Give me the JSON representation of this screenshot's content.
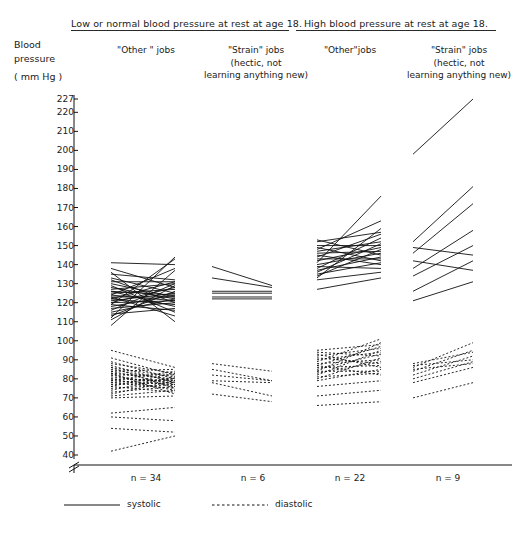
{
  "chart_data": {
    "type": "line",
    "title": "",
    "xlabel": "",
    "ylabel": "Blood pressure (mm Hg)",
    "ylim": [
      40,
      227
    ],
    "axis_break_below": 40,
    "grid": false,
    "legend_position": "bottom-left",
    "yticks": [
      227,
      220,
      210,
      200,
      190,
      180,
      170,
      160,
      150,
      140,
      130,
      120,
      110,
      100,
      90,
      80,
      70,
      60,
      50,
      40
    ],
    "x_categories": [
      "at age 18",
      "at follow-up"
    ],
    "groups": [
      {
        "panel": "Low or normal blood pressure at rest at age 18.",
        "job_type": "\"Other\" jobs",
        "n_label": "n = 34",
        "n": 34,
        "systolic": [
          [
            112,
            144
          ],
          [
            119,
            143
          ],
          [
            141,
            140
          ],
          [
            124,
            138
          ],
          [
            108,
            137
          ],
          [
            135,
            132
          ],
          [
            122,
            131
          ],
          [
            131,
            131
          ],
          [
            116,
            130
          ],
          [
            127,
            130
          ],
          [
            111,
            129
          ],
          [
            138,
            128
          ],
          [
            120,
            128
          ],
          [
            125,
            127
          ],
          [
            113,
            126
          ],
          [
            133,
            125
          ],
          [
            121,
            125
          ],
          [
            126,
            124
          ],
          [
            118,
            124
          ],
          [
            123,
            123
          ],
          [
            130,
            123
          ],
          [
            115,
            122
          ],
          [
            128,
            122
          ],
          [
            120,
            121
          ],
          [
            124,
            121
          ],
          [
            117,
            120
          ],
          [
            132,
            120
          ],
          [
            122,
            119
          ],
          [
            126,
            118
          ],
          [
            114,
            117
          ],
          [
            119,
            116
          ],
          [
            129,
            115
          ],
          [
            123,
            113
          ],
          [
            136,
            110
          ]
        ],
        "diastolic": [
          [
            95,
            86
          ],
          [
            84,
            85
          ],
          [
            79,
            84
          ],
          [
            88,
            83
          ],
          [
            76,
            83
          ],
          [
            82,
            82
          ],
          [
            91,
            82
          ],
          [
            74,
            81
          ],
          [
            86,
            81
          ],
          [
            78,
            80
          ],
          [
            83,
            80
          ],
          [
            89,
            80
          ],
          [
            72,
            79
          ],
          [
            80,
            79
          ],
          [
            85,
            79
          ],
          [
            77,
            78
          ],
          [
            81,
            78
          ],
          [
            87,
            78
          ],
          [
            75,
            77
          ],
          [
            79,
            77
          ],
          [
            84,
            77
          ],
          [
            73,
            76
          ],
          [
            82,
            76
          ],
          [
            78,
            75
          ],
          [
            86,
            75
          ],
          [
            71,
            74
          ],
          [
            80,
            74
          ],
          [
            76,
            73
          ],
          [
            83,
            72
          ],
          [
            70,
            71
          ],
          [
            62,
            65
          ],
          [
            60,
            58
          ],
          [
            54,
            52
          ],
          [
            42,
            50
          ]
        ]
      },
      {
        "panel": "Low or normal blood pressure at rest at age 18.",
        "job_type": "\"Strain\" jobs (hectic, not learning anything new)",
        "n_label": "n = 6",
        "n": 6,
        "systolic": [
          [
            139,
            129
          ],
          [
            133,
            128
          ],
          [
            126,
            126
          ],
          [
            125,
            125
          ],
          [
            123,
            123
          ],
          [
            122,
            122
          ]
        ],
        "diastolic": [
          [
            88,
            84
          ],
          [
            85,
            79
          ],
          [
            82,
            79
          ],
          [
            79,
            78
          ],
          [
            78,
            71
          ],
          [
            72,
            68
          ]
        ]
      },
      {
        "panel": "High blood pressure at rest at age 18.",
        "job_type": "\"Other\" jobs",
        "n_label": "n = 22",
        "n": 22,
        "systolic": [
          [
            141,
            176
          ],
          [
            148,
            163
          ],
          [
            133,
            159
          ],
          [
            152,
            157
          ],
          [
            144,
            156
          ],
          [
            138,
            154
          ],
          [
            147,
            152
          ],
          [
            136,
            151
          ],
          [
            150,
            150
          ],
          [
            142,
            149
          ],
          [
            134,
            148
          ],
          [
            146,
            147
          ],
          [
            140,
            146
          ],
          [
            153,
            145
          ],
          [
            137,
            144
          ],
          [
            143,
            143
          ],
          [
            149,
            142
          ],
          [
            135,
            141
          ],
          [
            145,
            140
          ],
          [
            139,
            138
          ],
          [
            132,
            136
          ],
          [
            127,
            133
          ]
        ],
        "diastolic": [
          [
            89,
            101
          ],
          [
            84,
            99
          ],
          [
            95,
            98
          ],
          [
            87,
            97
          ],
          [
            92,
            96
          ],
          [
            82,
            95
          ],
          [
            90,
            94
          ],
          [
            85,
            93
          ],
          [
            94,
            92
          ],
          [
            80,
            91
          ],
          [
            88,
            90
          ],
          [
            83,
            89
          ],
          [
            91,
            88
          ],
          [
            86,
            87
          ],
          [
            93,
            86
          ],
          [
            79,
            85
          ],
          [
            84,
            84
          ],
          [
            81,
            83
          ],
          [
            87,
            82
          ],
          [
            76,
            79
          ],
          [
            71,
            74
          ],
          [
            66,
            68
          ]
        ]
      },
      {
        "panel": "High blood pressure at rest at age 18.",
        "job_type": "\"Strain\" jobs (hectic, not learning anything new)",
        "n_label": "n = 9",
        "n": 9,
        "systolic": [
          [
            198,
            227
          ],
          [
            152,
            181
          ],
          [
            146,
            172
          ],
          [
            138,
            158
          ],
          [
            134,
            150
          ],
          [
            149,
            145
          ],
          [
            126,
            142
          ],
          [
            142,
            137
          ],
          [
            121,
            131
          ]
        ],
        "diastolic": [
          [
            86,
            99
          ],
          [
            84,
            95
          ],
          [
            88,
            94
          ],
          [
            82,
            92
          ],
          [
            87,
            90
          ],
          [
            80,
            89
          ],
          [
            85,
            88
          ],
          [
            78,
            86
          ],
          [
            70,
            78
          ]
        ]
      }
    ],
    "legend": [
      {
        "label": "systolic",
        "style": "solid"
      },
      {
        "label": "diastolic",
        "style": "dashed"
      }
    ]
  },
  "headers": {
    "left_panel": "Low or normal blood pressure at rest at age 18.",
    "right_panel": "High blood pressure at rest at age 18."
  },
  "columns": [
    {
      "line1": "\"Other \" jobs",
      "line2": "",
      "line3": ""
    },
    {
      "line1": "\"Strain\" jobs",
      "line2": "(hectic, not",
      "line3": "learning anything new)"
    },
    {
      "line1": "\"Other\"jobs",
      "line2": "",
      "line3": ""
    },
    {
      "line1": "\"Strain\" jobs",
      "line2": "(hectic, not",
      "line3": "learning anything new)"
    }
  ],
  "axis_title": {
    "line1": "Blood",
    "line2": "pressure",
    "line3": "( mm Hg )"
  },
  "n_labels": [
    "n = 34",
    "n = 6",
    "n = 22",
    "n = 9"
  ],
  "legend": {
    "systolic": "systolic",
    "diastolic": "diastolic"
  },
  "colors": {
    "ink": "#111111",
    "background": "#ffffff"
  }
}
